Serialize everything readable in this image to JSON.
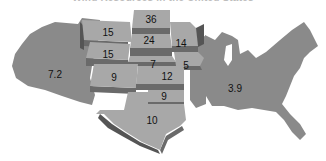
{
  "title": "Wind Resources in the United States",
  "colors": {
    "base_region": "#8a8a8a",
    "raised_top": "#a8a8a8",
    "raised_side": "#6a6a6a",
    "raised_side_dark": "#555555",
    "label": "#111111",
    "background": "#ffffff"
  },
  "regions": {
    "west": {
      "name": "West",
      "value": "7.2"
    },
    "east": {
      "name": "East",
      "value": "3.9"
    },
    "montana": {
      "name": "Montana",
      "value": "15"
    },
    "north_dakota": {
      "name": "North Dakota",
      "value": "36"
    },
    "south_dakota": {
      "name": "South Dakota",
      "value": "24"
    },
    "minnesota": {
      "name": "Minnesota",
      "value": "14"
    },
    "wyoming": {
      "name": "Wyoming",
      "value": "15"
    },
    "nebraska": {
      "name": "Nebraska",
      "value": "7"
    },
    "iowa": {
      "name": "Iowa",
      "value": "5"
    },
    "colorado": {
      "name": "Colorado",
      "value": "9"
    },
    "kansas": {
      "name": "Kansas",
      "value": "12"
    },
    "oklahoma": {
      "name": "Oklahoma",
      "value": "9"
    },
    "texas": {
      "name": "Texas",
      "value": "10"
    }
  }
}
